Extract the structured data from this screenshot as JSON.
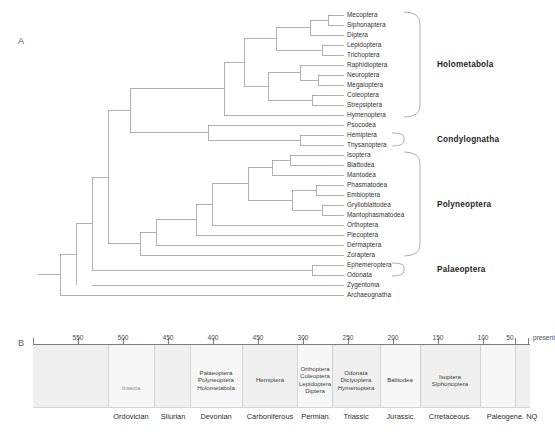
{
  "panels": {
    "a_letter": "A",
    "b_letter": "B"
  },
  "tree": {
    "tips": [
      {
        "name": "Mecoptera"
      },
      {
        "name": "Siphonaptera"
      },
      {
        "name": "Diptera"
      },
      {
        "name": "Lepidoptera"
      },
      {
        "name": "Trichoptera"
      },
      {
        "name": "Raphidioptera"
      },
      {
        "name": "Neuroptera"
      },
      {
        "name": "Megaloptera"
      },
      {
        "name": "Coleoptera"
      },
      {
        "name": "Strepsiptera"
      },
      {
        "name": "Hymenoptera"
      },
      {
        "name": "Psocodea"
      },
      {
        "name": "Hemiptera"
      },
      {
        "name": "Thysanoptera"
      },
      {
        "name": "Isoptera"
      },
      {
        "name": "Blattodea"
      },
      {
        "name": "Mantodea"
      },
      {
        "name": "Phasmatodea"
      },
      {
        "name": "Embioptera"
      },
      {
        "name": "Grylloblattodea"
      },
      {
        "name": "Mantophasmatodea"
      },
      {
        "name": "Orthoptera"
      },
      {
        "name": "Plecoptera"
      },
      {
        "name": "Dermaptera"
      },
      {
        "name": "Zoraptera"
      },
      {
        "name": "Ephemeroptera"
      },
      {
        "name": "Odonata"
      },
      {
        "name": "Zygentoma"
      },
      {
        "name": "Archaeognatha"
      }
    ],
    "clades": [
      {
        "name": "Holometabola",
        "label": "Holometabola"
      },
      {
        "name": "Condylognatha",
        "label": "Condylognatha"
      },
      {
        "name": "Polyneoptera",
        "label": "Polyneoptera"
      },
      {
        "name": "Palaeoptera",
        "label": "Palaeoptera"
      }
    ]
  },
  "timescale": {
    "ticks": [
      {
        "label": "550"
      },
      {
        "label": "500"
      },
      {
        "label": "450"
      },
      {
        "label": "400"
      },
      {
        "label": "450"
      },
      {
        "label": "300"
      },
      {
        "label": "250"
      },
      {
        "label": "200"
      },
      {
        "label": "150"
      },
      {
        "label": "100"
      },
      {
        "label": "50"
      },
      {
        "label": "present"
      }
    ],
    "periods": [
      {
        "label": "Ordovician"
      },
      {
        "label": "Silurian"
      },
      {
        "label": "Devonian"
      },
      {
        "label": "Carboniferous"
      },
      {
        "label": "Permian."
      },
      {
        "label": "Triassic"
      },
      {
        "label": "Jurassic."
      },
      {
        "label": "Crretaceous."
      },
      {
        "label": "Paleogene. NQ"
      }
    ],
    "band_labels": [
      {
        "name": "insecta",
        "text": "Insecta"
      },
      {
        "name": "devonian-clades",
        "lines": [
          "Palaeoptera",
          "Polyneoptera",
          "Holometabola"
        ]
      },
      {
        "name": "carboniferous-clades",
        "lines": [
          "Hemiptera"
        ]
      },
      {
        "name": "permian-clades",
        "lines": [
          "Orthoptera",
          "Coleoptera",
          "Lepidoptera",
          "Diptera"
        ]
      },
      {
        "name": "triassic-clades",
        "lines": [
          "Odonata",
          "Dictyoptera",
          "Hymenoptera"
        ]
      },
      {
        "name": "jurassic-clades",
        "lines": [
          "Balttodea"
        ]
      },
      {
        "name": "cretaceous-clades",
        "lines": [
          "Isoptera",
          "Siphonoptera"
        ]
      }
    ]
  },
  "colors": {
    "branch": "#8a8a8a",
    "band_fill": "#efefef",
    "band_edge": "#c9c9c9",
    "axis": "#7a7a7a",
    "text": "#2f2f2f"
  }
}
